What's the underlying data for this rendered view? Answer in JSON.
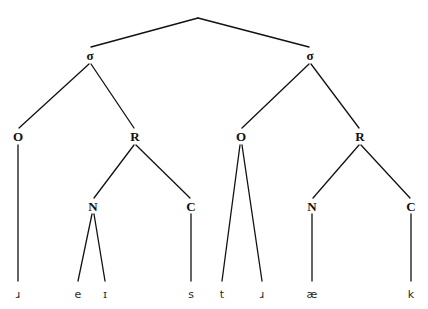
{
  "figure": {
    "name": "syllable-structure-tree",
    "background_color": "#ffffff",
    "line_color": "#111111",
    "transcription": "ɹeɪst.ɹæk",
    "word": "racetrack"
  },
  "root": {
    "label": "",
    "x": 198,
    "y": 15
  },
  "nodes": [
    {
      "id": "sigma1",
      "label": "σ",
      "x": 90,
      "y": 55,
      "type": "syllable"
    },
    {
      "id": "sigma2",
      "label": "σ",
      "x": 310,
      "y": 55,
      "type": "syllable"
    },
    {
      "id": "onset1",
      "label": "O",
      "x": 18,
      "y": 136,
      "type": "onset"
    },
    {
      "id": "rhyme1",
      "label": "R",
      "x": 135,
      "y": 136,
      "type": "rhyme"
    },
    {
      "id": "onset2",
      "label": "O",
      "x": 241,
      "y": 136,
      "type": "onset"
    },
    {
      "id": "rhyme2",
      "label": "R",
      "x": 360,
      "y": 136,
      "type": "rhyme"
    },
    {
      "id": "nucleus1",
      "label": "N",
      "x": 93,
      "y": 206,
      "type": "nucleus"
    },
    {
      "id": "coda1",
      "label": "C",
      "x": 191,
      "y": 206,
      "type": "coda"
    },
    {
      "id": "nucleus2",
      "label": "N",
      "x": 312,
      "y": 206,
      "type": "nucleus"
    },
    {
      "id": "coda2",
      "label": "C",
      "x": 411,
      "y": 206,
      "type": "coda"
    }
  ],
  "segments": [
    {
      "id": "seg-r1",
      "label": "ɹ",
      "x": 18,
      "y": 294
    },
    {
      "id": "seg-e",
      "label": "e",
      "x": 78,
      "y": 294
    },
    {
      "id": "seg-i",
      "label": "ɪ",
      "x": 105,
      "y": 294
    },
    {
      "id": "seg-s",
      "label": "s",
      "x": 191,
      "y": 294
    },
    {
      "id": "seg-t",
      "label": "t",
      "x": 222,
      "y": 294
    },
    {
      "id": "seg-r2",
      "label": "ɹ",
      "x": 262,
      "y": 294
    },
    {
      "id": "seg-ae",
      "label": "æ",
      "x": 312,
      "y": 294
    },
    {
      "id": "seg-k",
      "label": "k",
      "x": 411,
      "y": 294
    }
  ],
  "edges": [
    {
      "id": "edge-root-sigma1",
      "x1": 198,
      "y1": 18,
      "x2": 91,
      "y2": 47
    },
    {
      "id": "edge-root-sigma2",
      "x1": 198,
      "y1": 18,
      "x2": 309,
      "y2": 47
    },
    {
      "id": "edge-sigma1-onset1",
      "x1": 89,
      "y1": 64,
      "x2": 19,
      "y2": 128
    },
    {
      "id": "edge-sigma1-rhyme1",
      "x1": 91,
      "y1": 64,
      "x2": 134,
      "y2": 128
    },
    {
      "id": "edge-sigma2-onset2",
      "x1": 309,
      "y1": 64,
      "x2": 242,
      "y2": 128
    },
    {
      "id": "edge-sigma2-rhyme2",
      "x1": 311,
      "y1": 64,
      "x2": 359,
      "y2": 128
    },
    {
      "id": "edge-onset1-seg-r1",
      "x1": 18,
      "y1": 145,
      "x2": 18,
      "y2": 281
    },
    {
      "id": "edge-rhyme1-nucleus1",
      "x1": 134,
      "y1": 145,
      "x2": 94,
      "y2": 198
    },
    {
      "id": "edge-rhyme1-coda1",
      "x1": 136,
      "y1": 145,
      "x2": 190,
      "y2": 198
    },
    {
      "id": "edge-nucleus1-seg-e",
      "x1": 92,
      "y1": 214,
      "x2": 78,
      "y2": 281
    },
    {
      "id": "edge-nucleus1-seg-i",
      "x1": 94,
      "y1": 214,
      "x2": 105,
      "y2": 281
    },
    {
      "id": "edge-coda1-seg-s",
      "x1": 191,
      "y1": 214,
      "x2": 191,
      "y2": 281
    },
    {
      "id": "edge-onset2-seg-t",
      "x1": 240,
      "y1": 145,
      "x2": 222,
      "y2": 281
    },
    {
      "id": "edge-onset2-seg-r2",
      "x1": 242,
      "y1": 145,
      "x2": 262,
      "y2": 281
    },
    {
      "id": "edge-rhyme2-nucleus2",
      "x1": 359,
      "y1": 145,
      "x2": 313,
      "y2": 198
    },
    {
      "id": "edge-rhyme2-coda2",
      "x1": 361,
      "y1": 145,
      "x2": 410,
      "y2": 198
    },
    {
      "id": "edge-nucleus2-seg-ae",
      "x1": 312,
      "y1": 214,
      "x2": 312,
      "y2": 281
    },
    {
      "id": "edge-coda2-seg-k",
      "x1": 411,
      "y1": 214,
      "x2": 411,
      "y2": 281
    }
  ]
}
